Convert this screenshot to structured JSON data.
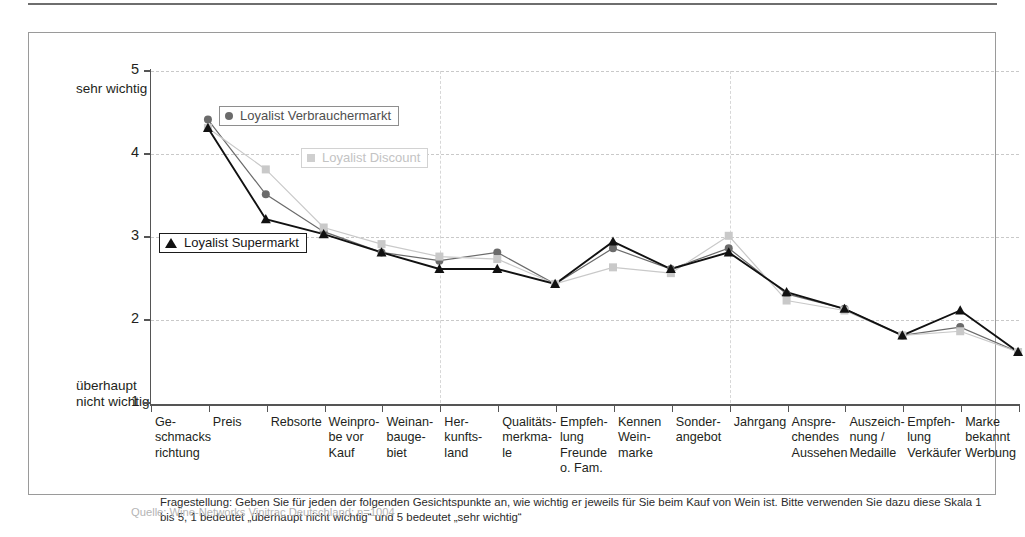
{
  "chart_data": {
    "type": "line",
    "title": "",
    "xlabel": "",
    "ylabel": "",
    "ylim": [
      1,
      5
    ],
    "yticks": [
      1,
      2,
      3,
      4,
      5
    ],
    "grid": true,
    "legend_position": "inside-plot",
    "axis_caption_top": "sehr\nwichtig",
    "axis_caption_bottom": "überhaupt\nnicht\nwichtig",
    "categories": [
      "Ge-\nschmacks\nrichtung",
      "Preis",
      "Rebsorte",
      "Weinpro-\nbe vor\nKauf",
      "Weinan-\nbauge-\nbiet",
      "Her-\nkunfts-\nland",
      "Qualitäts-\nmerkma-\nle",
      "Empfeh-\nlung\nFreunde\no. Fam.",
      "Kennen\nWein-\nmarke",
      "Sonder-\nangebot",
      "Jahrgang",
      "Anspre-\nchendes\nAussehen",
      "Auszeich-\nnung /\nMedaille",
      "Empfeh-\nlung\nVerkäufer",
      "Marke\nbekannt\nWerbung"
    ],
    "series": [
      {
        "name": "Loyalist Verbrauchermarkt",
        "marker": "circle",
        "color": "#6b6b6b",
        "values": [
          4.8,
          3.9,
          3.45,
          3.2,
          3.1,
          3.2,
          2.82,
          3.25,
          3.0,
          3.25,
          2.7,
          2.52,
          2.2,
          2.3,
          2.0
        ]
      },
      {
        "name": "Loyalist Discount",
        "marker": "square",
        "color": "#c9c9c9",
        "values": [
          4.7,
          4.2,
          3.5,
          3.3,
          3.15,
          3.12,
          2.82,
          3.02,
          2.95,
          3.4,
          2.62,
          2.5,
          2.2,
          2.25,
          2.0
        ]
      },
      {
        "name": "Loyalist Supermarkt",
        "marker": "triangle",
        "color": "#111111",
        "values": [
          4.7,
          3.6,
          3.42,
          3.2,
          3.0,
          3.0,
          2.82,
          3.33,
          3.0,
          3.2,
          2.72,
          2.52,
          2.2,
          2.5,
          2.0
        ]
      }
    ]
  },
  "legend": {
    "verbrauchermarkt": "Loyalist Verbrauchermarkt",
    "discount": "Loyalist Discount",
    "supermarkt": "Loyalist Supermarkt"
  },
  "notes": {
    "question": "Fragestellung: Geben Sie für jeden der folgenden Gesichtspunkte an, wie wichtig er jeweils für Sie beim Kauf von Wein ist. Bitte verwenden Sie dazu diese Skala 1 bis 5, 1 bedeutet „überhaupt nicht wichtig“ und 5 bedeutet „sehr wichtig“",
    "source": "Quelle: Wine-Networks Vinitrac Deutschland; n=1004"
  }
}
